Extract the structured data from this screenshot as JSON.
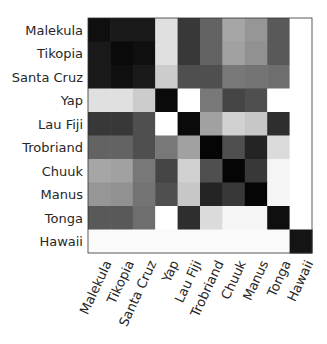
{
  "chart_data": {
    "type": "heatmap",
    "title": "",
    "xlabel": "",
    "ylabel": "",
    "colormap": "gray_r",
    "value_range": [
      0,
      1
    ],
    "row_labels": [
      "Malekula",
      "Tikopia",
      "Santa Cruz",
      "Yap",
      "Lau Fiji",
      "Trobriand",
      "Chuuk",
      "Manus",
      "Tonga",
      "Hawaii"
    ],
    "col_labels": [
      "Malekula",
      "Tikopia",
      "Santa Cruz",
      "Yap",
      "Lau Fiji",
      "Trobriand",
      "Chuuk",
      "Manus",
      "Tonga",
      "Hawaii"
    ],
    "values": [
      [
        0.94,
        0.9,
        0.9,
        0.12,
        0.78,
        0.61,
        0.35,
        0.41,
        0.65,
        0.0
      ],
      [
        0.9,
        0.96,
        0.94,
        0.12,
        0.78,
        0.61,
        0.37,
        0.43,
        0.65,
        0.0
      ],
      [
        0.9,
        0.94,
        0.9,
        0.2,
        0.69,
        0.69,
        0.53,
        0.55,
        0.57,
        0.0
      ],
      [
        0.12,
        0.12,
        0.2,
        0.96,
        0.0,
        0.53,
        0.73,
        0.69,
        0.0,
        0.0
      ],
      [
        0.78,
        0.78,
        0.69,
        0.0,
        0.96,
        0.37,
        0.18,
        0.22,
        0.82,
        0.0
      ],
      [
        0.61,
        0.61,
        0.69,
        0.53,
        0.37,
        0.98,
        0.69,
        0.86,
        0.14,
        0.0
      ],
      [
        0.35,
        0.37,
        0.53,
        0.73,
        0.18,
        0.69,
        0.98,
        0.78,
        0.04,
        0.0
      ],
      [
        0.41,
        0.43,
        0.55,
        0.69,
        0.22,
        0.86,
        0.78,
        0.98,
        0.04,
        0.0
      ],
      [
        0.65,
        0.65,
        0.57,
        0.0,
        0.82,
        0.14,
        0.04,
        0.04,
        0.94,
        0.0
      ],
      [
        0.02,
        0.02,
        0.02,
        0.02,
        0.02,
        0.02,
        0.02,
        0.02,
        0.02,
        0.92
      ]
    ]
  }
}
